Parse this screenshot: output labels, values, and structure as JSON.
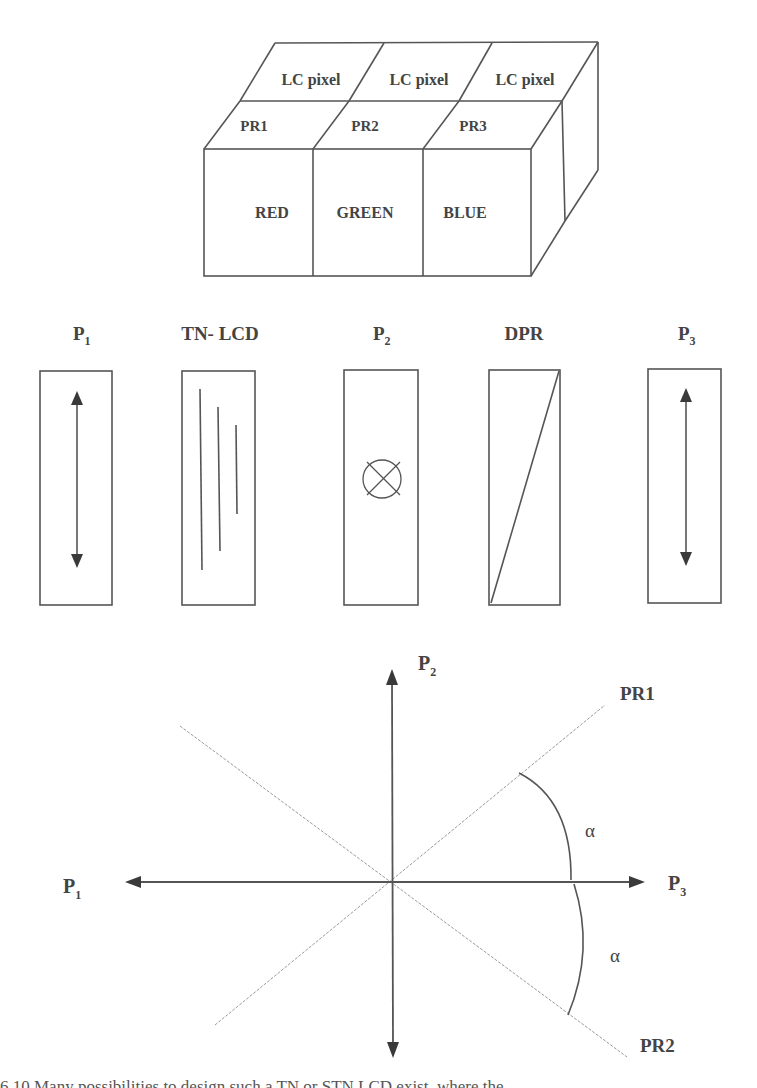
{
  "cube": {
    "top_row": [
      "LC pixel",
      "LC pixel",
      "LC pixel"
    ],
    "middle_row": [
      "PR1",
      "PR2",
      "PR3"
    ],
    "front_row": [
      "RED",
      "GREEN",
      "BLUE"
    ]
  },
  "components": [
    {
      "label": "P",
      "sub": "1",
      "symbol": "vertical-double-arrow"
    },
    {
      "label": "TN- LCD",
      "sub": "",
      "symbol": "director-lines"
    },
    {
      "label": "P",
      "sub": "2",
      "symbol": "into-page-cross-circle"
    },
    {
      "label": "DPR",
      "sub": "",
      "symbol": "diagonal"
    },
    {
      "label": "P",
      "sub": "3",
      "symbol": "vertical-double-arrow"
    }
  ],
  "axes": {
    "up": {
      "label": "P",
      "sub": "2"
    },
    "left": {
      "label": "P",
      "sub": "1"
    },
    "right": {
      "label": "P",
      "sub": "3"
    },
    "diag_upper_right": "PR1",
    "diag_lower_right": "PR2",
    "angle_upper": "α",
    "angle_lower": "α"
  },
  "caption": "6.10  Many possibilities to design such a TN or STN LCD exist, where the"
}
